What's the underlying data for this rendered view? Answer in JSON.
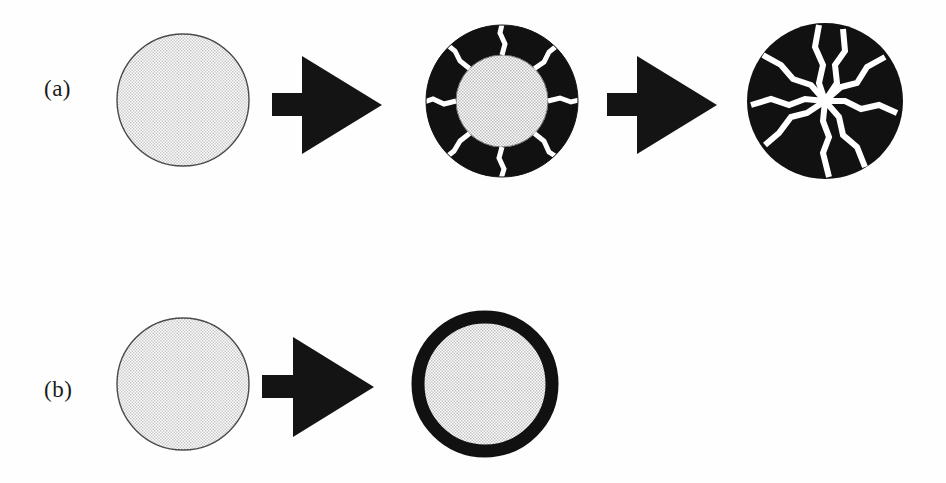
{
  "figure": {
    "background_color": "#fefefe",
    "width": 946,
    "height": 483,
    "ink_color": "#111111",
    "core_fill_color": "#d9d9d9",
    "crack_color": "#ffffff"
  },
  "rows": [
    {
      "id": "row-a",
      "label": "(a)",
      "label_x": 44,
      "label_y": 88,
      "stages": [
        {
          "id": "a-stage-1",
          "kind": "plain-core",
          "name": "uncoated-particle",
          "cx": 183,
          "cy": 100,
          "r": 68
        },
        {
          "id": "a-arrow-1",
          "kind": "arrow",
          "name": "process-arrow",
          "x": 272,
          "y": 55,
          "w": 108,
          "h": 100
        },
        {
          "id": "a-stage-2",
          "kind": "cracked-shell",
          "name": "partially-cracked-coated-particle",
          "cx": 502,
          "cy": 101,
          "r": 77,
          "core_r": 44,
          "crack_count": 8
        },
        {
          "id": "a-arrow-2",
          "kind": "arrow",
          "name": "process-arrow",
          "x": 607,
          "y": 55,
          "w": 108,
          "h": 100
        },
        {
          "id": "a-stage-3",
          "kind": "fully-cracked",
          "name": "fully-fractured-particle",
          "cx": 824,
          "cy": 100,
          "r": 78,
          "crack_count": 9
        }
      ]
    },
    {
      "id": "row-b",
      "label": "(b)",
      "label_x": 44,
      "label_y": 389,
      "stages": [
        {
          "id": "b-stage-1",
          "kind": "plain-core",
          "name": "uncoated-particle",
          "cx": 183,
          "cy": 384,
          "r": 68
        },
        {
          "id": "b-arrow-1",
          "kind": "arrow",
          "name": "process-arrow",
          "x": 262,
          "y": 336,
          "w": 110,
          "h": 102
        },
        {
          "id": "b-stage-2",
          "kind": "intact-shell",
          "name": "intact-coated-particle",
          "cx": 484,
          "cy": 383,
          "r": 73,
          "ring_thickness": 13
        }
      ]
    }
  ],
  "icons": {
    "arrow": "right-arrow-icon",
    "particle": "circle-particle-icon"
  }
}
